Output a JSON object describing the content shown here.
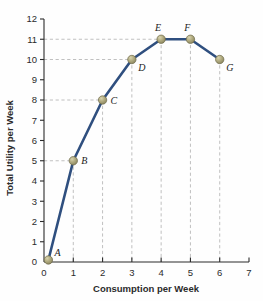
{
  "chart_data": {
    "type": "line",
    "title": "",
    "xlabel": "Consumption per Week",
    "ylabel": "Total Utility per Week",
    "xlim": [
      0,
      7
    ],
    "ylim": [
      0,
      12
    ],
    "xticks": [
      "0",
      "1",
      "2",
      "3",
      "4",
      "5",
      "6",
      "7"
    ],
    "yticks": [
      "0",
      "1",
      "2",
      "3",
      "4",
      "5",
      "6",
      "7",
      "8",
      "9",
      "10",
      "11",
      "12"
    ],
    "grid": "dashed-guides-to-points",
    "legend": "none",
    "x": [
      0.15,
      1,
      2,
      3,
      4,
      5,
      6
    ],
    "values": [
      0.1,
      5,
      8,
      10,
      11,
      11,
      10
    ],
    "point_labels": [
      "A",
      "B",
      "C",
      "D",
      "E",
      "F",
      "G"
    ],
    "series": [
      {
        "name": "Total Utility",
        "points": [
          {
            "label": "A",
            "x": 0.15,
            "y": 0.1,
            "label_pos": "upper-right"
          },
          {
            "label": "B",
            "x": 1,
            "y": 5,
            "label_pos": "right"
          },
          {
            "label": "C",
            "x": 2,
            "y": 8,
            "label_pos": "right"
          },
          {
            "label": "D",
            "x": 3,
            "y": 10,
            "label_pos": "lower-right"
          },
          {
            "label": "E",
            "x": 4,
            "y": 11,
            "label_pos": "upper-left"
          },
          {
            "label": "F",
            "x": 5,
            "y": 11,
            "label_pos": "upper-left"
          },
          {
            "label": "G",
            "x": 6,
            "y": 10,
            "label_pos": "lower-right"
          }
        ]
      }
    ],
    "colors": {
      "line": "#2f4f7f",
      "marker_fill": "#a8a276",
      "marker_highlight": "#cfcaa4",
      "marker_edge": "#6e6a4a",
      "axis": "#2b2b2b",
      "grid": "#b9b9b9",
      "background": "#fefefe"
    }
  }
}
